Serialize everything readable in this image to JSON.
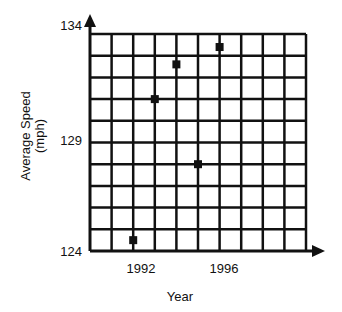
{
  "chart_data": {
    "type": "scatter",
    "title": "",
    "xlabel": "Year",
    "ylabel": "Average Speed",
    "ylabel_units": "(mph)",
    "x": [
      1992,
      1993,
      1994,
      1995,
      1996
    ],
    "y": [
      124.5,
      131.0,
      132.6,
      128.0,
      133.4
    ],
    "series": [
      {
        "name": "Average Speed",
        "x": [
          1992,
          1993,
          1994,
          1995,
          1996
        ],
        "values": [
          124.5,
          131.0,
          132.6,
          128.0,
          133.4
        ]
      }
    ],
    "xlim": [
      1990,
      2000
    ],
    "ylim": [
      124,
      134
    ],
    "x_ticks": [
      1992,
      1996
    ],
    "y_ticks": [
      124,
      129,
      134
    ],
    "grid": true,
    "grid_x_step": 1,
    "grid_y_step": 1,
    "legend": "none",
    "marker": "square",
    "colors": {
      "ink": "#111111",
      "background": "#ffffff"
    }
  },
  "axes": {
    "x_label": "Year",
    "y_label_line1": "Average Speed",
    "y_label_line2": "(mph)",
    "x_tick_labels": [
      "1992",
      "1996"
    ],
    "y_tick_labels": [
      "124",
      "129",
      "134"
    ]
  }
}
